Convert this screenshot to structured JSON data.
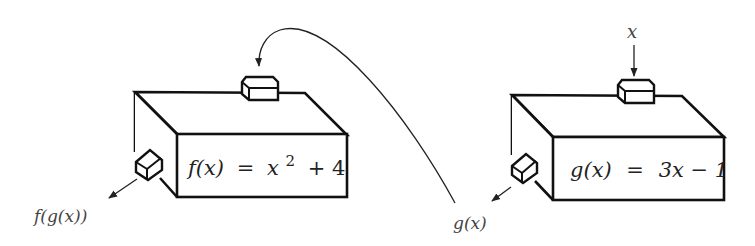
{
  "diagram": {
    "machines": [
      {
        "id": "g",
        "formula_name": "g(x)",
        "formula_eq": "=",
        "formula_rhs": "3x − 1",
        "input_label": "x",
        "output_label": "g(x)"
      },
      {
        "id": "f",
        "formula_name": "f(x)",
        "formula_eq": "=",
        "formula_rhs_base": "x",
        "formula_rhs_exp": "2",
        "formula_rhs_tail": "+ 4",
        "input_from": "g(x)",
        "output_label": "f(g(x))"
      }
    ],
    "connector": {
      "from": "g(x)",
      "to": "f input",
      "style": "curved-arrow"
    },
    "colors": {
      "line": "#111111",
      "text": "#222222",
      "background": "#ffffff"
    }
  }
}
